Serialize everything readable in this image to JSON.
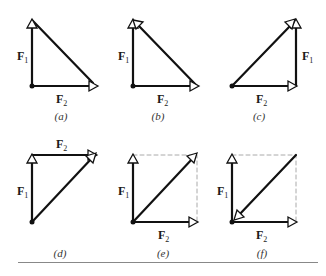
{
  "figure": {
    "panels": [
      {
        "id": "a",
        "caption": "(a)",
        "f1_label": "F",
        "f1_sub": "1",
        "f2_label": "F",
        "f2_sub": "2"
      },
      {
        "id": "b",
        "caption": "(b)",
        "f1_label": "F",
        "f1_sub": "1",
        "f2_label": "F",
        "f2_sub": "2"
      },
      {
        "id": "c",
        "caption": "(c)",
        "f1_label": "F",
        "f1_sub": "1",
        "f2_label": "F",
        "f2_sub": "2"
      },
      {
        "id": "d",
        "caption": "(d)",
        "f1_label": "F",
        "f1_sub": "1",
        "f2_label": "F",
        "f2_sub": "2"
      },
      {
        "id": "e",
        "caption": "(e)",
        "f1_label": "F",
        "f1_sub": "1",
        "f2_label": "F",
        "f2_sub": "2"
      },
      {
        "id": "f",
        "caption": "(f)",
        "f1_label": "F",
        "f1_sub": "1",
        "f2_label": "F",
        "f2_sub": "2"
      }
    ],
    "colors": {
      "vector": "#111111",
      "dashed": "#aaaaaa",
      "rule": "#888888"
    }
  }
}
